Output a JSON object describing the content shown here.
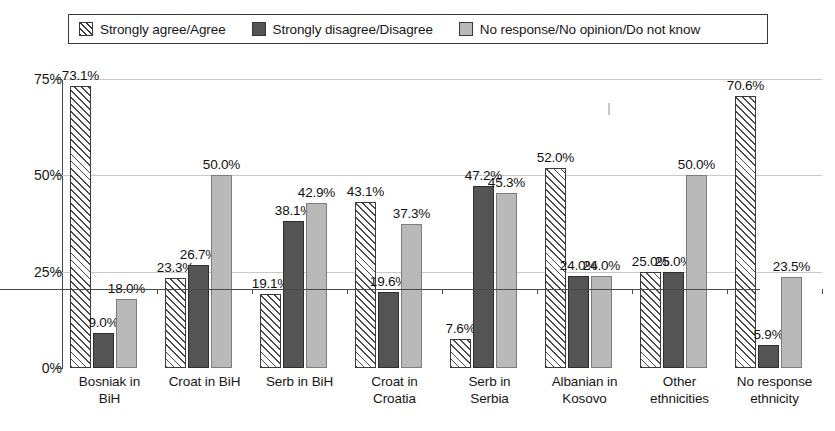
{
  "legend": {
    "entries": [
      {
        "label": "Strongly agree/Agree",
        "swatch": "hatch-diagonal-icon",
        "color": "#ffffff"
      },
      {
        "label": "Strongly disagree/Disagree",
        "swatch": "solid-dark-icon",
        "color": "#545454"
      },
      {
        "label": "No response/No opinion/Do not know",
        "swatch": "solid-light-icon",
        "color": "#b9b9b9"
      }
    ]
  },
  "axis": {
    "y_ticks": [
      "0%",
      "25%",
      "50%",
      "75%"
    ]
  },
  "chart_data": {
    "type": "bar",
    "title": "",
    "subtitle": "",
    "xlabel": "",
    "ylabel": "",
    "ylim": [
      0,
      75
    ],
    "ytick_values": [
      0,
      25,
      50,
      75
    ],
    "ytick_labels": [
      "0%",
      "25%",
      "50%",
      "75%"
    ],
    "grid": true,
    "legend_position": "top",
    "categories": [
      "Bosniak in BiH",
      "Croat in BiH",
      "Serb in BiH",
      "Croat in Croatia",
      "Serb in Serbia",
      "Albanian in Kosovo",
      "Other ethnicities",
      "No response ethnicity"
    ],
    "category_lines": [
      [
        "Bosniak in",
        "BiH"
      ],
      [
        "Croat in BiH",
        ""
      ],
      [
        "Serb in BiH",
        ""
      ],
      [
        "Croat in",
        "Croatia"
      ],
      [
        "Serb in",
        "Serbia"
      ],
      [
        "Albanian in",
        "Kosovo"
      ],
      [
        "Other",
        "ethnicities"
      ],
      [
        "No response",
        "ethnicity"
      ]
    ],
    "series": [
      {
        "name": "Strongly agree/Agree",
        "color": "#ffffff",
        "pattern": "diagonal-hatch",
        "values": [
          73.1,
          23.3,
          19.1,
          43.1,
          7.6,
          52.0,
          25.0,
          70.6
        ],
        "labels": [
          "73.1%",
          "23.3%",
          "19.1%",
          "43.1%",
          "7.6%",
          "52.0%",
          "25.0%",
          "70.6%"
        ]
      },
      {
        "name": "Strongly disagree/Disagree",
        "color": "#545454",
        "pattern": "solid",
        "values": [
          9.0,
          26.7,
          38.1,
          19.6,
          47.2,
          24.0,
          25.0,
          5.9
        ],
        "labels": [
          "9.0%",
          "26.7%",
          "38.1%",
          "19.6%",
          "47.2%",
          "24.0%",
          "25.0%",
          "5.9%"
        ]
      },
      {
        "name": "No response/No opinion/Do not know",
        "color": "#b9b9b9",
        "pattern": "solid",
        "values": [
          18.0,
          50.0,
          42.9,
          37.3,
          45.3,
          24.0,
          50.0,
          23.5
        ],
        "labels": [
          "18.0%",
          "50.0%",
          "42.9%",
          "37.3%",
          "45.3%",
          "24.0%",
          "50.0%",
          "23.5%"
        ]
      }
    ]
  },
  "layout": {
    "plot_left": 62,
    "plot_top": 79,
    "plot_width": 760,
    "plot_height": 289,
    "value_max": 75,
    "bar_width": 21,
    "bar_gap": 2,
    "group_width": 95,
    "group_inner_offset": 8,
    "label_overrides": {
      "2_0_dy": -2,
      "4_2_dx": 0
    }
  }
}
